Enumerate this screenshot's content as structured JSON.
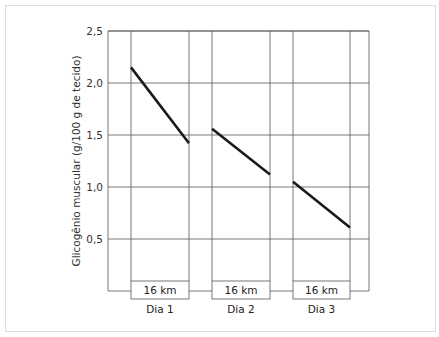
{
  "chart_data": {
    "type": "line",
    "title": "",
    "xlabel": "",
    "ylabel": "Glicogênio muscular (g/100 g de tecido)",
    "ylim": [
      0,
      2.5
    ],
    "yticks": [
      "0,5",
      "1,0",
      "1,5",
      "2,0",
      "2,5"
    ],
    "grid": true,
    "categories": [
      "Dia 1",
      "Dia 2",
      "Dia 3"
    ],
    "box_labels": [
      "16 km",
      "16 km",
      "16 km"
    ],
    "series": [
      {
        "name": "Dia 1",
        "start": 2.15,
        "end": 1.42
      },
      {
        "name": "Dia 2",
        "start": 1.56,
        "end": 1.12
      },
      {
        "name": "Dia 3",
        "start": 1.05,
        "end": 0.61
      }
    ]
  }
}
